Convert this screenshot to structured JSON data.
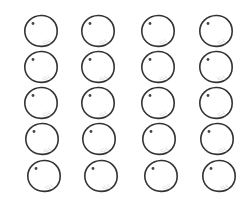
{
  "figure": {
    "rows": 5,
    "cols": 4,
    "item": "circle-with-dot",
    "stroke_color": "#333333",
    "dot_color": "#444444",
    "speckle_color": "#bbbbbb",
    "background": "#ffffff"
  },
  "cells": [
    {
      "x": 23,
      "y": 14
    },
    {
      "x": 80,
      "y": 14
    },
    {
      "x": 140,
      "y": 14
    },
    {
      "x": 198,
      "y": 14
    },
    {
      "x": 23,
      "y": 50
    },
    {
      "x": 80,
      "y": 50
    },
    {
      "x": 140,
      "y": 50
    },
    {
      "x": 198,
      "y": 50
    },
    {
      "x": 23,
      "y": 86
    },
    {
      "x": 80,
      "y": 86
    },
    {
      "x": 140,
      "y": 86
    },
    {
      "x": 198,
      "y": 86
    },
    {
      "x": 24,
      "y": 122
    },
    {
      "x": 81,
      "y": 122
    },
    {
      "x": 141,
      "y": 122
    },
    {
      "x": 199,
      "y": 122
    },
    {
      "x": 26,
      "y": 159
    },
    {
      "x": 83,
      "y": 159
    },
    {
      "x": 143,
      "y": 159
    },
    {
      "x": 201,
      "y": 159
    }
  ]
}
